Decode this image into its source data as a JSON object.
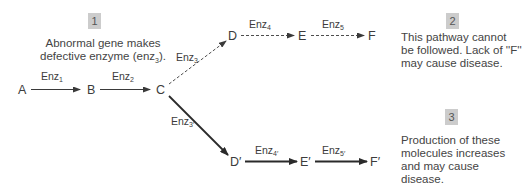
{
  "notes": [
    {
      "number": "1",
      "lines": [
        "Abnormal gene makes",
        "defective enzyme (enz"
      ],
      "line2_sub": "3",
      "line2_end": ")."
    },
    {
      "number": "2",
      "lines": [
        "This pathway cannot",
        "be followed. Lack of ''F''",
        "may cause disease."
      ]
    },
    {
      "number": "3",
      "lines": [
        "Production of these",
        "molecules increases",
        "and may cause",
        "disease."
      ]
    }
  ],
  "nodes": {
    "A": "A",
    "B": "B",
    "C": "C",
    "D": "D",
    "E": "E",
    "F": "F",
    "D2": "D′",
    "E2": "E′",
    "F2": "F′"
  },
  "enzymes": {
    "enz1": {
      "base": "Enz",
      "sub": "1"
    },
    "enz2": {
      "base": "Enz",
      "sub": "2"
    },
    "enz3": {
      "base": "Enz",
      "sub": "3"
    },
    "enz4": {
      "base": "Enz",
      "sub": "4"
    },
    "enz5": {
      "base": "Enz",
      "sub": "5"
    },
    "enz3p": {
      "base": "Enz",
      "sub": "3′"
    },
    "enz4p": {
      "base": "Enz",
      "sub": "4′"
    },
    "enz5p": {
      "base": "Enz",
      "sub": "5′"
    }
  },
  "colors": {
    "badge": "#cccccc",
    "line": "#3a3a3a",
    "text": "#3c3c3c"
  }
}
